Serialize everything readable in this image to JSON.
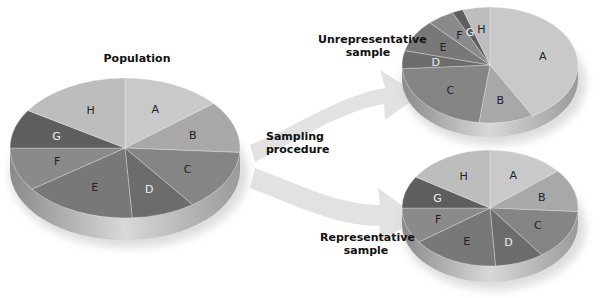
{
  "labels": {
    "population": "Population",
    "sampling_line1": "Sampling",
    "sampling_line2": "procedure",
    "unrep_line1": "Unrepresentative",
    "unrep_line2": "sample",
    "rep_line1": "Representative",
    "rep_line2": "sample"
  },
  "colors": {
    "A": "#c9c9c9",
    "B": "#a8a8a8",
    "C": "#858585",
    "D": "#6c6c6c",
    "E": "#787878",
    "F": "#8a8a8a",
    "G": "#5e5e5e",
    "H": "#bdbdbd",
    "arrow": "#dedede"
  },
  "chart_data": [
    {
      "type": "pie",
      "title": "Population",
      "categories": [
        "A",
        "B",
        "C",
        "D",
        "E",
        "F",
        "G",
        "H"
      ],
      "values": [
        14,
        12,
        14,
        9,
        16,
        10,
        9,
        16
      ]
    },
    {
      "type": "pie",
      "title": "Unrepresentative sample",
      "categories": [
        "A",
        "B",
        "C",
        "D",
        "E",
        "F",
        "G",
        "H"
      ],
      "values": [
        42,
        10,
        22,
        5,
        9,
        5,
        2,
        5
      ]
    },
    {
      "type": "pie",
      "title": "Representative sample",
      "categories": [
        "A",
        "B",
        "C",
        "D",
        "E",
        "F",
        "G",
        "H"
      ],
      "values": [
        14,
        12,
        14,
        9,
        16,
        10,
        9,
        16
      ]
    }
  ]
}
